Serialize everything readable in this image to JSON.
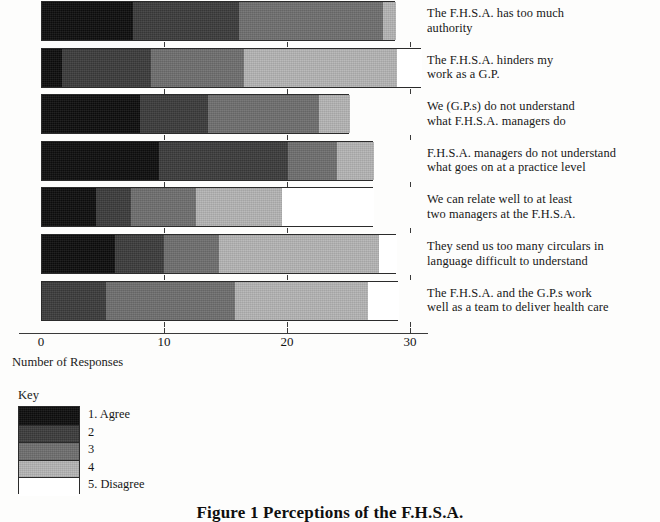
{
  "caption": "Figure 1 Perceptions of the F.H.S.A.",
  "axis": {
    "title": "Number of Responses",
    "ticks": [
      "0",
      "10",
      "20",
      "30"
    ]
  },
  "key": {
    "title": "Key",
    "items": [
      {
        "label": "1. Agree",
        "color": "#0d0d0d"
      },
      {
        "label": "2",
        "color": "#3b3b3b"
      },
      {
        "label": "3",
        "color": "#6e6e6e"
      },
      {
        "label": "4",
        "color": "#b4b4b4"
      },
      {
        "label": "5. Disagree",
        "color": "#ffffff"
      }
    ]
  },
  "chart_data": {
    "type": "bar",
    "orientation": "horizontal",
    "stacked": true,
    "title": "Figure 1 Perceptions of the F.H.S.A.",
    "xlabel": "Number of Responses",
    "ylabel": "",
    "xlim": [
      0,
      31
    ],
    "grid": false,
    "legend_position": "bottom-left",
    "xticks": [
      0,
      10,
      20,
      30
    ],
    "categories": [
      "The F.H.S.A. has too much authority",
      "The F.H.S.A. hinders my work as a G.P.",
      "We (G.P.s) do not understand what F.H.S.A. managers do",
      "F.H.S.A. managers do not understand what goes on at a practice level",
      "We can relate well to at least two managers at the F.H.S.A.",
      "They send us too many circulars in language difficult to understand",
      "The F.H.S.A. and the G.P.s work well as a team to deliver health care"
    ],
    "category_lines": [
      [
        "The F.H.S.A. has too much",
        "authority"
      ],
      [
        "The F.H.S.A. hinders my",
        "work as a G.P."
      ],
      [
        "We (G.P.s) do not understand",
        "what F.H.S.A. managers do"
      ],
      [
        "F.H.S.A. managers do not understand",
        "what goes on at a practice level"
      ],
      [
        "We can relate well to at least",
        "two managers at the F.H.S.A."
      ],
      [
        "They send us too many circulars in",
        "language difficult to understand"
      ],
      [
        "The F.H.S.A. and the G.P.s work",
        "well as a team to deliver health care"
      ]
    ],
    "series": [
      {
        "name": "1. Agree",
        "values": [
          7.4,
          1.6,
          8.0,
          9.5,
          4.4,
          5.9,
          0.0
        ]
      },
      {
        "name": "2",
        "values": [
          8.6,
          7.3,
          5.5,
          10.5,
          2.8,
          4.0,
          5.2
        ]
      },
      {
        "name": "3",
        "values": [
          11.7,
          7.5,
          9.0,
          4.0,
          5.3,
          4.5,
          10.5
        ]
      },
      {
        "name": "4",
        "values": [
          1.1,
          12.5,
          2.5,
          3.0,
          7.0,
          13.0,
          10.8
        ]
      },
      {
        "name": "5. Disagree",
        "values": [
          0.0,
          2.0,
          0.0,
          0.0,
          7.5,
          1.5,
          2.5
        ]
      }
    ],
    "totals": [
      28.8,
      30.9,
      25.0,
      27.0,
      27.0,
      28.9,
      29.0
    ]
  }
}
